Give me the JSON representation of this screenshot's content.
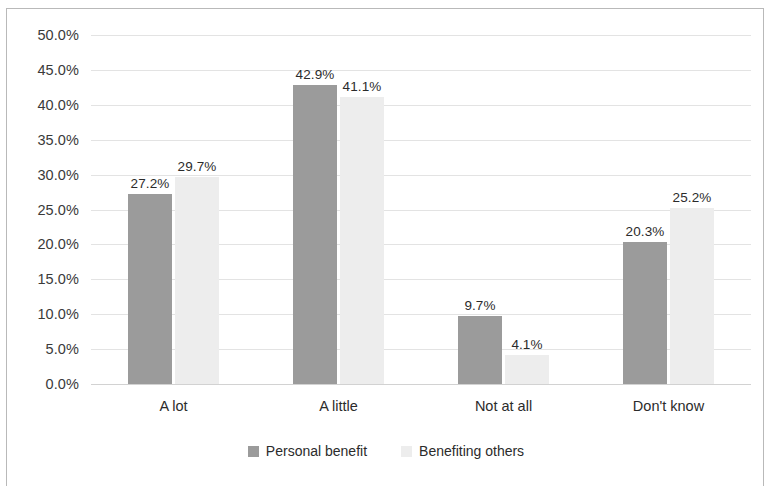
{
  "chart_data": {
    "type": "bar",
    "title": "",
    "subtitle": "",
    "xlabel": "",
    "ylabel": "",
    "categories": [
      "A lot",
      "A little",
      "Not at all",
      "Don't know"
    ],
    "series": [
      {
        "name": "Personal benefit",
        "color": "#9b9b9b",
        "values": [
          27.2,
          42.9,
          9.7,
          20.3
        ],
        "labels": [
          "27.2%",
          "42.9%",
          "9.7%",
          "20.3%"
        ]
      },
      {
        "name": "Benefiting others",
        "color": "#ededed",
        "values": [
          29.7,
          41.1,
          4.1,
          25.2
        ],
        "labels": [
          "29.7%",
          "41.1%",
          "4.1%",
          "25.2%"
        ]
      }
    ],
    "ylim": [
      0,
      50
    ],
    "ytick_step": 5,
    "ytick_labels": [
      "0.0%",
      "5.0%",
      "10.0%",
      "15.0%",
      "20.0%",
      "25.0%",
      "30.0%",
      "35.0%",
      "40.0%",
      "45.0%",
      "50.0%"
    ],
    "grid": true,
    "grid_color": "#e3e3e3",
    "legend_position": "bottom",
    "border_color": "#b9b9b9",
    "background": "#ffffff"
  }
}
